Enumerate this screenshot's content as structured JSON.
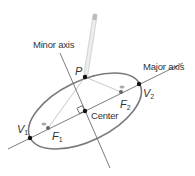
{
  "diagram": {
    "type": "ellipse-construction",
    "labels": {
      "minor_axis": "Minor axis",
      "major_axis": "Major axis",
      "center": "Center",
      "point_p": "P",
      "vertex1": "V",
      "vertex1_sub": "1",
      "vertex2": "V",
      "vertex2_sub": "2",
      "focus1": "F",
      "focus1_sub": "1",
      "focus2": "F",
      "focus2_sub": "2"
    },
    "colors": {
      "ellipse": "#7a7a7a",
      "axes": "#5a5a5a",
      "string": "#c8c8c8",
      "points": "#111111",
      "text": "#333333"
    }
  }
}
